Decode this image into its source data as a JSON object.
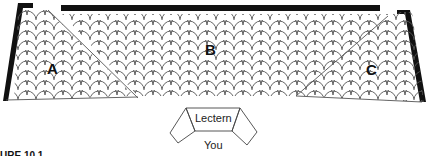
{
  "diagram": {
    "type": "classroom-seating-layout",
    "sections": [
      {
        "id": "A",
        "label": "A",
        "position": "left"
      },
      {
        "id": "B",
        "label": "B",
        "position": "center"
      },
      {
        "id": "C",
        "label": "C",
        "position": "right"
      }
    ],
    "lectern": {
      "label": "Lectern"
    },
    "viewer": {
      "label": "You"
    },
    "caption": "URE 10.1"
  },
  "colors": {
    "wall": "#111111",
    "seat_outline": "#555555",
    "background": "#ffffff"
  }
}
